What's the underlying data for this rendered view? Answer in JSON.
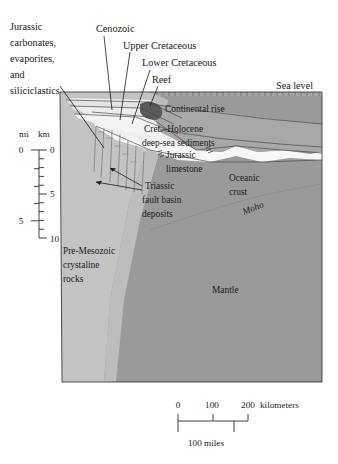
{
  "figure": {
    "type": "geologic-cross-section",
    "background_color": "#ffffff"
  },
  "callouts": [
    {
      "id": "jurassic-carbonates",
      "lines": [
        "Jurassic",
        "carbonates,",
        "evaporites,",
        "and",
        "siliciclastics"
      ],
      "x": 10,
      "y": 22
    },
    {
      "id": "cenozoic",
      "lines": [
        "Cenozoic"
      ],
      "x": 96,
      "y": 27
    },
    {
      "id": "upper-cretaceous",
      "lines": [
        "Upper Cretaceous"
      ],
      "x": 123,
      "y": 44
    },
    {
      "id": "lower-cretaceous",
      "lines": [
        "Lower Cretaceous"
      ],
      "x": 142,
      "y": 61
    },
    {
      "id": "reef",
      "lines": [
        "Reef"
      ],
      "x": 152,
      "y": 78
    },
    {
      "id": "sea-level",
      "lines": [
        "Sea level"
      ],
      "x": 278,
      "y": 89
    }
  ],
  "inner_labels": [
    {
      "id": "continental-rise",
      "lines": [
        "Continental rise"
      ],
      "x": 165,
      "y": 112
    },
    {
      "id": "cret-holocene-sediments",
      "lines": [
        "Cret.–Holocene",
        "deep-sea sediments"
      ],
      "x": 146,
      "y": 134
    },
    {
      "id": "jurassic-limestone",
      "lines": [
        "Jurassic",
        "limestone"
      ],
      "x": 166,
      "y": 155
    },
    {
      "id": "triassic-fault-basin",
      "lines": [
        "Triassic",
        "fault basin",
        "deposits"
      ],
      "x": 145,
      "y": 186
    },
    {
      "id": "oceanic-crust",
      "lines": [
        "Oceanic",
        "crust"
      ],
      "x": 229,
      "y": 178
    },
    {
      "id": "moho",
      "lines": [
        "Moho"
      ],
      "x": 248,
      "y": 208,
      "rotation": -22
    },
    {
      "id": "mantle",
      "lines": [
        "Mantle"
      ],
      "x": 212,
      "y": 290
    },
    {
      "id": "pre-mesozoic",
      "lines": [
        "Pre-Mesozoic",
        "crystaline",
        "rocks"
      ],
      "x": 63,
      "y": 251
    }
  ],
  "vertical_scale": {
    "unit_left_label": "mi",
    "unit_right_label": "km",
    "left_ticks": [
      {
        "label": "0",
        "km": 0
      },
      {
        "label": "5",
        "km": 8.047
      }
    ],
    "right_ticks": [
      {
        "label": "0",
        "km": 0
      },
      {
        "label": "5",
        "km": 5
      },
      {
        "label": "10",
        "km": 10
      }
    ],
    "km_range": [
      0,
      10
    ]
  },
  "horizontal_scale": {
    "km_label": "kilometers",
    "km_ticks": [
      "0",
      "100",
      "200"
    ],
    "mi_label": "100 miles",
    "mi_tick_km": 160.9
  },
  "colors": {
    "mantle": "#9a9a9a",
    "oceanic_crust": "#9a9a9a",
    "continental_basement": "#c3c3c3",
    "sediment_light": "#d9d9d9",
    "sediment_pale": "#efefef",
    "white_layer": "#f7f7f7",
    "reef_dark": "#5a5a5a",
    "water": "#9a9a9a",
    "outline": "#3d3d3d",
    "text": "#1a1a1a"
  }
}
